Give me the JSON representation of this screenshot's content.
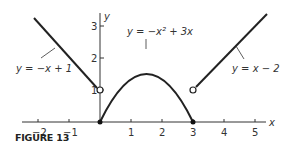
{
  "figure": {
    "caption": "FIGURE 13",
    "axes": {
      "x_label": "x",
      "y_label": "y",
      "x_ticks": [
        "−2",
        "−1",
        "1",
        "2",
        "3",
        "4",
        "5"
      ],
      "y_ticks": [
        "1",
        "2",
        "3"
      ]
    },
    "pieces": [
      {
        "label": "y = −x + 1",
        "domain": "x < 0",
        "endpoint": {
          "x": 0,
          "y": 1,
          "type": "open"
        }
      },
      {
        "label": "y = −x² + 3x",
        "domain": "0 ≤ x ≤ 3",
        "endpoints": [
          {
            "x": 0,
            "y": 0,
            "type": "closed"
          },
          {
            "x": 3,
            "y": 0,
            "type": "closed"
          }
        ]
      },
      {
        "label": "y = x − 2",
        "domain": "x > 3",
        "endpoint": {
          "x": 3,
          "y": 1,
          "type": "open"
        }
      }
    ],
    "labels": {
      "left": "y = −x + 1",
      "middle": "y = −x² + 3x",
      "right": "y = x − 2"
    }
  }
}
